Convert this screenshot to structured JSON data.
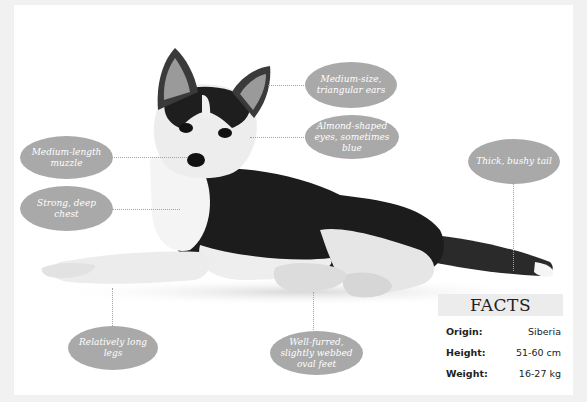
{
  "callouts": {
    "ears": {
      "text": "Medium-size, triangular ears"
    },
    "eyes": {
      "text": "Almond-shaped eyes, sometimes blue"
    },
    "muzzle": {
      "text": "Medium-length muzzle"
    },
    "chest": {
      "text": "Strong, deep chest"
    },
    "tail": {
      "text": "Thick, bushy tail"
    },
    "legs": {
      "text": "Relatively long legs"
    },
    "feet": {
      "text": "Well-furred, slightly webbed oval feet"
    }
  },
  "facts": {
    "title": "FACTS",
    "rows": [
      {
        "label": "Origin:",
        "value": "Siberia"
      },
      {
        "label": "Height:",
        "value": "51-60 cm"
      },
      {
        "label": "Weight:",
        "value": "16-27 kg"
      }
    ]
  },
  "colors": {
    "background": "#f1f1f1",
    "card": "#ffffff",
    "callout": "#a9a9a9",
    "facts_header": "#ececec"
  }
}
